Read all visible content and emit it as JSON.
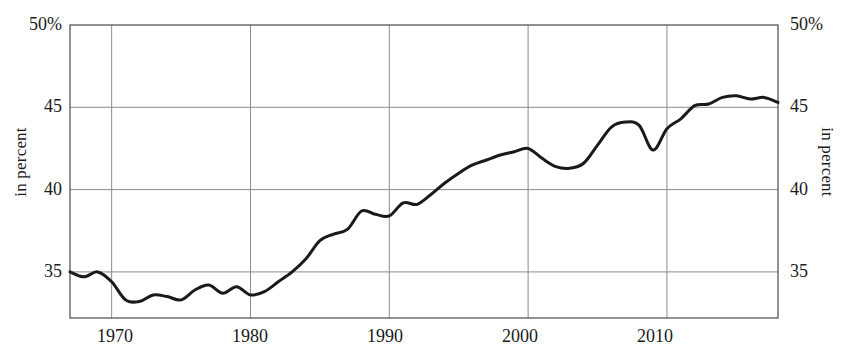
{
  "chart_data": {
    "type": "line",
    "title": "",
    "subtitle": "",
    "xlabel": "",
    "ylabel": "in percent",
    "ylabel_right": "in percent",
    "xlim": [
      1967,
      2018
    ],
    "ylim": [
      32.2,
      50
    ],
    "grid": true,
    "legend": null,
    "legend_position": "none",
    "y_ticks": [
      35,
      40,
      45,
      50
    ],
    "y_tick_labels": [
      "35",
      "40",
      "45",
      "50%"
    ],
    "x_ticks": [
      1970,
      1980,
      1990,
      2000,
      2010
    ],
    "x_tick_labels": [
      "1970",
      "1980",
      "1990",
      "2000",
      "2010"
    ],
    "line_color": "#1a1a1a",
    "line_width": 3,
    "series": [
      {
        "name": "share",
        "x": [
          1967,
          1968,
          1969,
          1970,
          1971,
          1972,
          1973,
          1974,
          1975,
          1976,
          1977,
          1978,
          1979,
          1980,
          1981,
          1982,
          1983,
          1984,
          1985,
          1986,
          1987,
          1988,
          1989,
          1990,
          1991,
          1992,
          1993,
          1994,
          1995,
          1996,
          1997,
          1998,
          1999,
          2000,
          2001,
          2002,
          2003,
          2004,
          2005,
          2006,
          2007,
          2008,
          2009,
          2010,
          2011,
          2012,
          2013,
          2014,
          2015,
          2016,
          2017,
          2018
        ],
        "values": [
          35.0,
          34.7,
          35.0,
          34.4,
          33.3,
          33.2,
          33.6,
          33.5,
          33.3,
          33.9,
          34.2,
          33.7,
          34.1,
          33.6,
          33.8,
          34.4,
          35.0,
          35.8,
          36.9,
          37.3,
          37.6,
          38.7,
          38.5,
          38.4,
          39.2,
          39.1,
          39.7,
          40.4,
          41.0,
          41.5,
          41.8,
          42.1,
          42.3,
          42.5,
          41.9,
          41.4,
          41.3,
          41.6,
          42.7,
          43.8,
          44.1,
          43.9,
          42.4,
          43.7,
          44.3,
          45.1,
          45.2,
          45.6,
          45.7,
          45.5,
          45.6,
          45.3
        ]
      }
    ]
  },
  "axis": {
    "left_title": "in percent",
    "right_title": "in percent",
    "y_labels_left": [
      "50%",
      "45",
      "40",
      "35"
    ],
    "y_labels_right": [
      "50%",
      "45",
      "40",
      "35"
    ],
    "x_labels": [
      "1970",
      "1980",
      "1990",
      "2000",
      "2010"
    ]
  }
}
